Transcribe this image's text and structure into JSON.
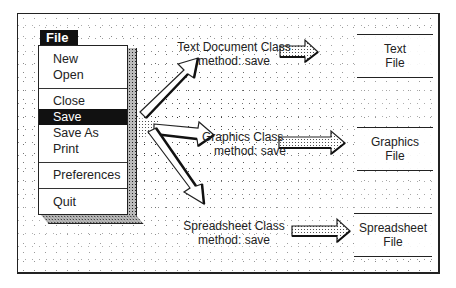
{
  "menu": {
    "title": "File",
    "items": [
      {
        "label": "New",
        "selected": false
      },
      {
        "label": "Open",
        "selected": false
      },
      {
        "label": "Close",
        "selected": false
      },
      {
        "label": "Save",
        "selected": true
      },
      {
        "label": "Save As",
        "selected": false
      },
      {
        "label": "Print",
        "selected": false
      },
      {
        "label": "Preferences",
        "selected": false
      },
      {
        "label": "Quit",
        "selected": false
      }
    ]
  },
  "classes": [
    {
      "name": "Text Document Class",
      "method": "method: save",
      "output_line1": "Text",
      "output_line2": "File"
    },
    {
      "name": "Graphics Class",
      "method": "method: save",
      "output_line1": "Graphics",
      "output_line2": "File"
    },
    {
      "name": "Spreadsheet Class",
      "method": "method: save",
      "output_line1": "Spreadsheet",
      "output_line2": "File"
    }
  ],
  "colors": {
    "ink": "#1a1a1a",
    "paper": "#ffffff",
    "stipple": "#333333"
  }
}
